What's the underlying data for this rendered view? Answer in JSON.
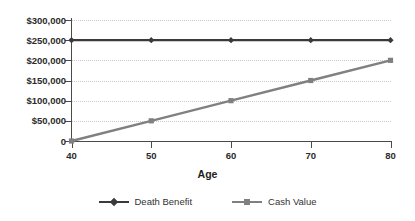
{
  "chart_data": {
    "type": "line",
    "title": "",
    "xlabel": "Age",
    "ylabel": "",
    "x": [
      40,
      50,
      60,
      70,
      80
    ],
    "xlim": [
      40,
      80
    ],
    "ylim": [
      0,
      300000
    ],
    "grid": true,
    "legend_position": "bottom",
    "xtick_labels": [
      "40",
      "50",
      "60",
      "70",
      "80"
    ],
    "ytick_labels": [
      "0",
      "$50,000",
      "$100,000",
      "$150,000",
      "$200,000",
      "$250,000",
      "$300,000"
    ],
    "ytick_values": [
      0,
      50000,
      100000,
      150000,
      200000,
      250000,
      300000
    ],
    "series": [
      {
        "name": "Death Benefit",
        "color": "#3a3a3a",
        "marker": "diamond",
        "values": [
          250000,
          250000,
          250000,
          250000,
          250000
        ]
      },
      {
        "name": "Cash Value",
        "color": "#808080",
        "marker": "square",
        "values": [
          0,
          50000,
          100000,
          150000,
          200000
        ]
      }
    ]
  },
  "axis": {
    "x_title": "Age"
  },
  "legend": {
    "items": [
      {
        "label": "Death Benefit"
      },
      {
        "label": "Cash Value"
      }
    ]
  },
  "style": {
    "background": "#ffffff",
    "axis_color": "#4a4a4a",
    "grid_color": "#c9c9c9",
    "text_color": "#2b2b2b"
  }
}
